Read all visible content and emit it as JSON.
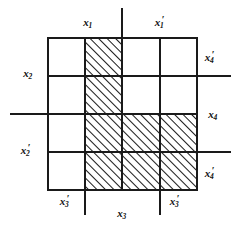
{
  "figure": {
    "type": "grid-diagram",
    "grid": {
      "columns": 4,
      "rows": 4,
      "left": 48,
      "top": 38,
      "right": 197,
      "bottom": 190,
      "x_lines": [
        48,
        85,
        122,
        160,
        197
      ],
      "y_lines": [
        38,
        76,
        114,
        152,
        190
      ]
    },
    "shaded_cells": [
      {
        "col": 2,
        "row": 1
      },
      {
        "col": 2,
        "row": 2
      },
      {
        "col": 2,
        "row": 3
      },
      {
        "col": 2,
        "row": 4
      },
      {
        "col": 3,
        "row": 3
      },
      {
        "col": 3,
        "row": 4
      },
      {
        "col": 4,
        "row": 3
      },
      {
        "col": 4,
        "row": 4
      }
    ],
    "extension_lines": [
      {
        "orientation": "vertical",
        "pos": 122,
        "from": 8,
        "to": 38
      },
      {
        "orientation": "vertical",
        "pos": 85,
        "from": 190,
        "to": 215
      },
      {
        "orientation": "vertical",
        "pos": 160,
        "from": 190,
        "to": 215
      },
      {
        "orientation": "horizontal",
        "pos": 114,
        "from": 10,
        "to": 48
      },
      {
        "orientation": "horizontal",
        "pos": 76,
        "from": 197,
        "to": 231
      },
      {
        "orientation": "horizontal",
        "pos": 152,
        "from": 197,
        "to": 231
      }
    ],
    "stroke_color": "#1a1a1a",
    "hatch_color": "#1a1a1a",
    "background_color": "#ffffff"
  },
  "labels": {
    "top_left": {
      "base": "x",
      "sub": "1",
      "prime": false,
      "x": 88,
      "y": 22
    },
    "top_right": {
      "base": "x",
      "sub": "1",
      "prime": true,
      "x": 161,
      "y": 22
    },
    "left_upper": {
      "base": "x",
      "sub": "2",
      "prime": false,
      "x": 28,
      "y": 73
    },
    "left_lower": {
      "base": "x",
      "sub": "2",
      "prime": true,
      "x": 27,
      "y": 150
    },
    "right_upper": {
      "base": "x",
      "sub": "4",
      "prime": true,
      "x": 211,
      "y": 57
    },
    "right_middle": {
      "base": "x",
      "sub": "4",
      "prime": false,
      "x": 213,
      "y": 114
    },
    "right_lower": {
      "base": "x",
      "sub": "4",
      "prime": true,
      "x": 211,
      "y": 173
    },
    "bottom_left": {
      "base": "x",
      "sub": "3",
      "prime": true,
      "x": 66,
      "y": 201
    },
    "bottom_center": {
      "base": "x",
      "sub": "3",
      "prime": false,
      "x": 122,
      "y": 213
    },
    "bottom_right": {
      "base": "x",
      "sub": "3",
      "prime": true,
      "x": 176,
      "y": 201
    }
  }
}
